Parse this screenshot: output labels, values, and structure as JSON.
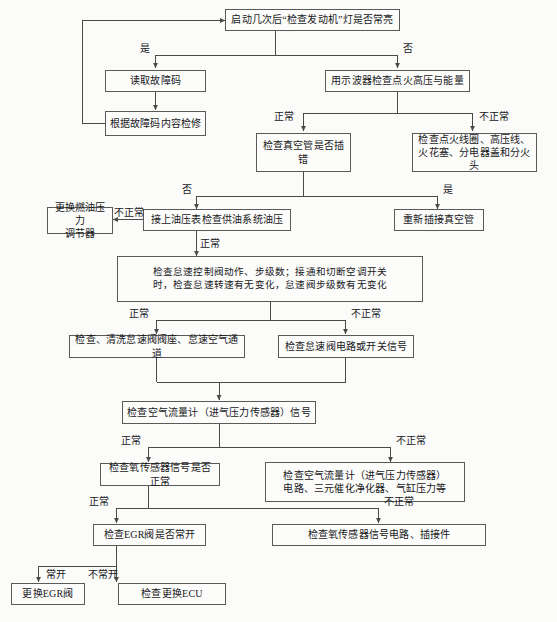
{
  "diagram": {
    "nodes": [
      {
        "id": "n1",
        "label": "启动几次后“检查发动机”灯是否常亮"
      },
      {
        "id": "n2",
        "label": "读取故障码"
      },
      {
        "id": "n3",
        "label": "根据故障码内容检修"
      },
      {
        "id": "n4",
        "label": "用示波器检查点火高压与能量"
      },
      {
        "id": "n5",
        "label": "检查真空管是否插错"
      },
      {
        "id": "n6",
        "label": "检查点火线圈、高压线、\n火花塞、分电器盖和分火头"
      },
      {
        "id": "n7",
        "label": "更换燃油压力\n调节器"
      },
      {
        "id": "n8",
        "label": "接上油压表检查供油系统油压"
      },
      {
        "id": "n9",
        "label": "重新插接真空管"
      },
      {
        "id": "n10",
        "label": "检查怠速控制阀动作、步级数；接通和切断空调开关\n时，检查怠速转速有无变化，怠速阀步级数有无变化"
      },
      {
        "id": "n11",
        "label": "检查、清洗怠速阀阀座、怠速空气通道"
      },
      {
        "id": "n12",
        "label": "检查怠速阀电路或开关信号"
      },
      {
        "id": "n13",
        "label": "检查空气流量计（进气压力传感器）信号"
      },
      {
        "id": "n14",
        "label": "检查氧传感器信号是否正常"
      },
      {
        "id": "n15",
        "label": "检查空气流量计（进气压力传感器）\n电路、三元催化净化器、气缸压力等"
      },
      {
        "id": "n16",
        "label": "检查EGR阀是否常开"
      },
      {
        "id": "n17",
        "label": "检查氧传感器信号电路、插接件"
      },
      {
        "id": "n18",
        "label": "更换EGR阀"
      },
      {
        "id": "n19",
        "label": "检查更换ECU"
      }
    ],
    "edge_labels": [
      {
        "id": "e1",
        "text": "是"
      },
      {
        "id": "e2",
        "text": "否"
      },
      {
        "id": "e3",
        "text": "正常"
      },
      {
        "id": "e4",
        "text": "不正常"
      },
      {
        "id": "e5",
        "text": "否"
      },
      {
        "id": "e6",
        "text": "是"
      },
      {
        "id": "e7",
        "text": "不正常"
      },
      {
        "id": "e8",
        "text": "正常"
      },
      {
        "id": "e9",
        "text": "正常"
      },
      {
        "id": "e10",
        "text": "不正常"
      },
      {
        "id": "e11",
        "text": "正常"
      },
      {
        "id": "e12",
        "text": "不正常"
      },
      {
        "id": "e13",
        "text": "正常"
      },
      {
        "id": "e14",
        "text": "不正常"
      },
      {
        "id": "e15",
        "text": "常开"
      },
      {
        "id": "e16",
        "text": "不常开"
      }
    ],
    "colors": {
      "box_border": "#5a5a58",
      "box_fill": "#fcfcfb",
      "line": "#4a4a48",
      "text": "#17171a",
      "page_bg": "#fbfbfa"
    }
  }
}
